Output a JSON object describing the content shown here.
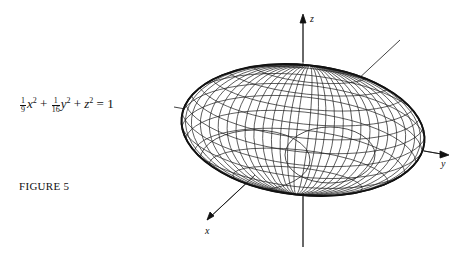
{
  "equation": {
    "frac1": {
      "num": "1",
      "den": "9"
    },
    "term1": "x",
    "frac2": {
      "num": "1",
      "den": "16"
    },
    "term2": "y",
    "term3": "z",
    "exp": "2",
    "plus": "+",
    "equals": "=",
    "rhs": "1"
  },
  "figure_label": "FIGURE 5",
  "axes": {
    "x": "x",
    "y": "y",
    "z": "z"
  }
}
